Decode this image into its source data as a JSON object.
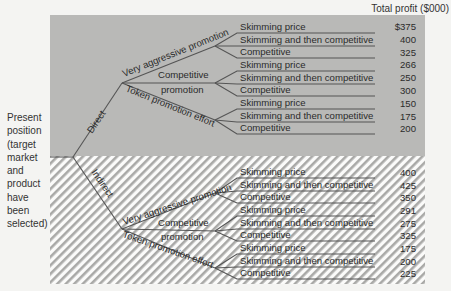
{
  "header": {
    "total_profit_label": "Total profit ($000)"
  },
  "root": {
    "label_lines": [
      "Present",
      "position",
      "(target",
      "market",
      "and",
      "product",
      "have",
      "been",
      "selected)"
    ]
  },
  "colors": {
    "direct_bg": "#b9b9b7",
    "indirect_bg": "#ffffff",
    "hatch": "#a9a9a7",
    "line": "#5a5a5a"
  },
  "channels": [
    {
      "label": "Direct",
      "promotions": [
        {
          "label": "Very aggressive promotion",
          "options": [
            {
              "label": "Skimming price",
              "profit": "$375"
            },
            {
              "label": "Skimming and then competitive",
              "profit": "400"
            },
            {
              "label": "Competitive",
              "profit": "325"
            }
          ]
        },
        {
          "label": "Competitive promotion",
          "label_lines": [
            "Competitive",
            "promotion"
          ],
          "options": [
            {
              "label": "Skimming price",
              "profit": "266"
            },
            {
              "label": "Skimming and then competitive",
              "profit": "250"
            },
            {
              "label": "Competitive",
              "profit": "300"
            }
          ]
        },
        {
          "label": "Token promotion effort",
          "options": [
            {
              "label": "Skimming price",
              "profit": "150"
            },
            {
              "label": "Skimming and then competitive",
              "profit": "175"
            },
            {
              "label": "Competitive",
              "profit": "200"
            }
          ]
        }
      ]
    },
    {
      "label": "Indirect",
      "promotions": [
        {
          "label": "Very aggressive promotion",
          "options": [
            {
              "label": "Skimming price",
              "profit": "400"
            },
            {
              "label": "Skimming and then competitive",
              "profit": "425"
            },
            {
              "label": "Competitive",
              "profit": "350"
            }
          ]
        },
        {
          "label": "Competitive promotion",
          "label_lines": [
            "Competitive",
            "promotion"
          ],
          "options": [
            {
              "label": "Skimming price",
              "profit": "291"
            },
            {
              "label": "Skimming and then competitive",
              "profit": "275"
            },
            {
              "label": "Competitive",
              "profit": "325"
            }
          ]
        },
        {
          "label": "Token promotion effort",
          "options": [
            {
              "label": "Skimming price",
              "profit": "175"
            },
            {
              "label": "Skimming and then competitive",
              "profit": "200"
            },
            {
              "label": "Competitive",
              "profit": "225"
            }
          ]
        }
      ]
    }
  ]
}
